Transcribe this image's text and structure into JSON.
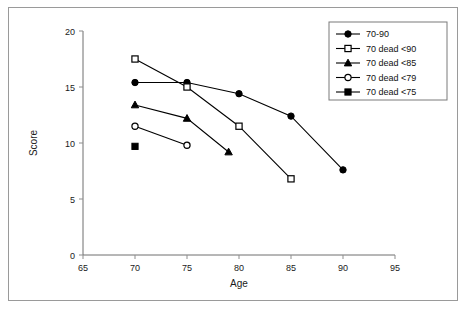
{
  "chart_data": {
    "type": "line",
    "title": "",
    "xlabel": "Age",
    "ylabel": "Score",
    "xlim": [
      65,
      95
    ],
    "ylim": [
      0,
      20
    ],
    "xticks": [
      65,
      70,
      75,
      80,
      85,
      90,
      95
    ],
    "yticks": [
      0,
      5,
      10,
      15,
      20
    ],
    "grid": false,
    "legend_position": "top-right",
    "series": [
      {
        "name": "70-90",
        "marker": "filled-circle",
        "x": [
          70,
          75,
          80,
          85,
          90
        ],
        "values": [
          15.4,
          15.4,
          14.4,
          12.4,
          7.6
        ]
      },
      {
        "name": "70 dead <90",
        "marker": "open-square",
        "x": [
          70,
          75,
          80,
          85
        ],
        "values": [
          17.5,
          15.0,
          11.5,
          6.8
        ]
      },
      {
        "name": "70 dead <85",
        "marker": "filled-triangle",
        "x": [
          70,
          75,
          79
        ],
        "values": [
          13.4,
          12.2,
          9.2
        ]
      },
      {
        "name": "70 dead <79",
        "marker": "open-circle",
        "x": [
          70,
          75
        ],
        "values": [
          11.5,
          9.8
        ]
      },
      {
        "name": "70 dead <75",
        "marker": "filled-square",
        "x": [
          70
        ],
        "values": [
          9.7
        ]
      }
    ]
  },
  "legend": {
    "entries": [
      {
        "label": "70-90"
      },
      {
        "label": "70 dead <90"
      },
      {
        "label": "70 dead <85"
      },
      {
        "label": "70 dead <79"
      },
      {
        "label": "70 dead <75"
      }
    ]
  },
  "axes": {
    "x_title": "Age",
    "y_title": "Score",
    "x_tick_labels": [
      "65",
      "70",
      "75",
      "80",
      "85",
      "90",
      "95"
    ],
    "y_tick_labels": [
      "0",
      "5",
      "10",
      "15",
      "20"
    ]
  },
  "colors": {
    "ink": "#000000",
    "axis": "#6f6f6f",
    "frame": "#9a9a9a",
    "background": "#ffffff"
  }
}
